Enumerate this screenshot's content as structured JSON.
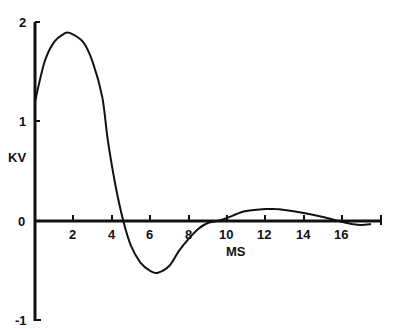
{
  "chart_data": {
    "type": "line",
    "title": "",
    "xlabel": "MS",
    "ylabel": "KV",
    "xlim": [
      0,
      18
    ],
    "ylim": [
      -1,
      2
    ],
    "x_ticks": [
      2,
      4,
      6,
      8,
      10,
      12,
      14,
      16
    ],
    "y_ticks": [
      -1,
      0,
      1,
      2
    ],
    "grid": false,
    "series": [
      {
        "name": "waveform",
        "x": [
          0,
          0.5,
          1,
          1.5,
          1.8,
          2.5,
          3,
          3.5,
          3.8,
          4.2,
          4.6,
          5,
          5.5,
          6,
          6.4,
          7,
          7.5,
          8,
          8.5,
          9,
          9.5,
          10,
          10.5,
          11,
          12,
          12.5,
          13,
          14,
          15,
          15.8,
          16.5,
          17,
          17.5
        ],
        "y": [
          1.2,
          1.6,
          1.8,
          1.88,
          1.89,
          1.8,
          1.6,
          1.25,
          0.8,
          0.35,
          0,
          -0.25,
          -0.42,
          -0.5,
          -0.52,
          -0.45,
          -0.3,
          -0.18,
          -0.08,
          -0.02,
          0.0,
          0.03,
          0.07,
          0.1,
          0.12,
          0.12,
          0.11,
          0.08,
          0.04,
          0.0,
          -0.03,
          -0.04,
          -0.03
        ]
      }
    ]
  },
  "labels": {
    "y_axis": "KV",
    "x_axis": "MS",
    "y_tick_2": "2",
    "y_tick_1": "1",
    "y_tick_0": "0",
    "y_tick_m1": "-1",
    "x_tick_2": "2",
    "x_tick_4": "4",
    "x_tick_6": "6",
    "x_tick_8": "8",
    "x_tick_10": "10",
    "x_tick_12": "12",
    "x_tick_14": "14",
    "x_tick_16": "16"
  }
}
